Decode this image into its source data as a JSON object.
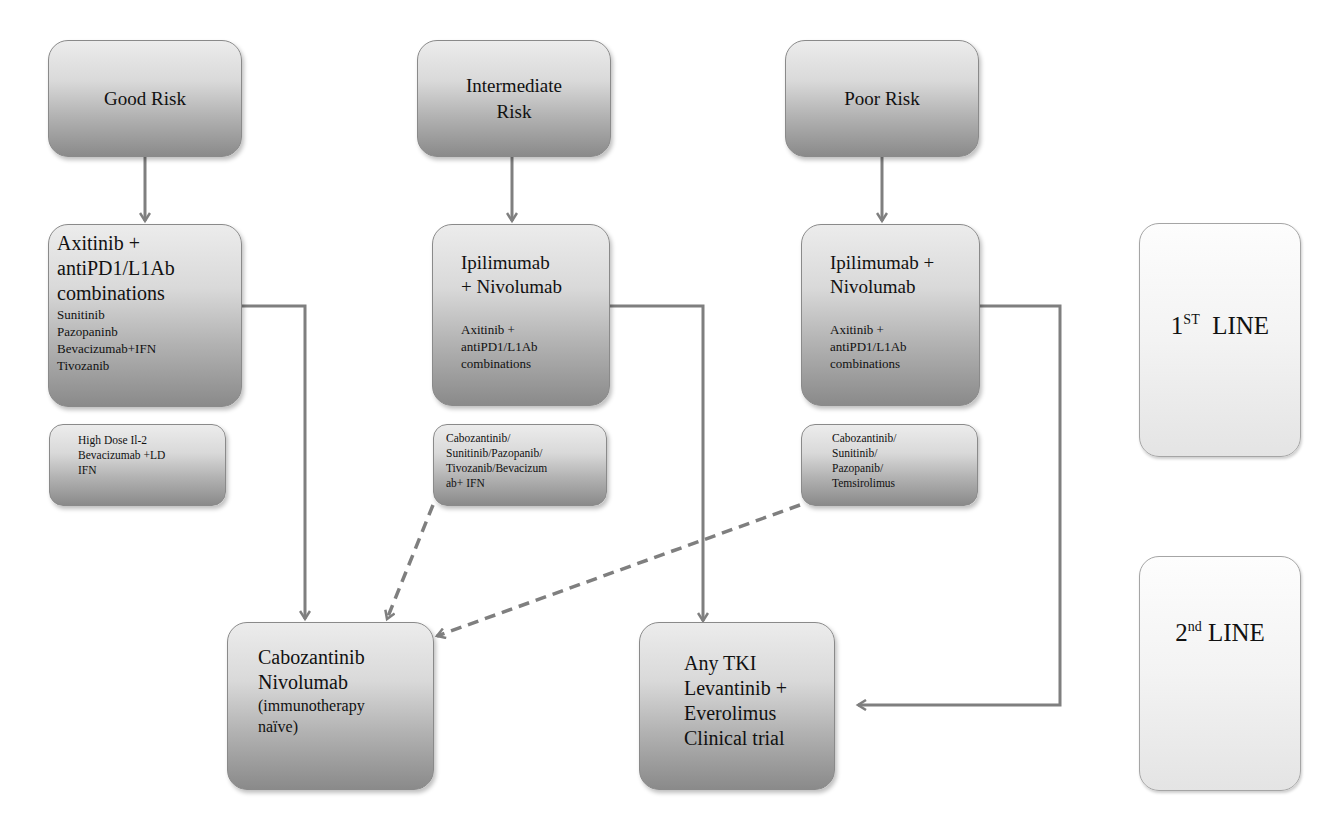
{
  "diagram": {
    "columns": {
      "good": {
        "risk_label": "Good Risk",
        "first_line": {
          "primary": "Axitinib +\nantiPD1/L1Ab\ncombinations",
          "secondary": "Sunitinib\nPazopaninb\nBevacizumab+IFN\nTivozanib"
        },
        "alternatives": "High Dose Il-2\nBevacizumab +LD\nIFN"
      },
      "intermediate": {
        "risk_label": "Intermediate\nRisk",
        "first_line": {
          "primary": "Ipilimumab\n+ Nivolumab",
          "secondary": "Axitinib +\nantiPD1/L1Ab\ncombinations"
        },
        "alternatives": "Cabozantinib/\nSunitinib/Pazopanib/\nTivozanib/Bevacizum\nab+ IFN"
      },
      "poor": {
        "risk_label": "Poor Risk",
        "first_line": {
          "primary": "Ipilimumab +\nNivolumab",
          "secondary": "Axitinib +\nantiPD1/L1Ab\ncombinations"
        },
        "alternatives": "Cabozantinib/\nSunitinib/\nPazopanib/\nTemsirolimus"
      }
    },
    "second_line": {
      "after_tki": {
        "main": "Cabozantinib\nNivolumab",
        "note": "(immunotherapy\nnaïve)"
      },
      "after_io": "Any TKI\nLevantinib +\nEverolimus\nClinical trial"
    },
    "line_labels": {
      "first": {
        "number": "1",
        "suffix": "ST",
        "word": "LINE"
      },
      "second": {
        "number": "2",
        "suffix": "nd",
        "word": "LINE"
      }
    },
    "colors": {
      "arrow": "#7f7f7f",
      "box_top": "#ececec",
      "box_bottom": "#8a8a8a",
      "label_box": "#f3f3f3"
    },
    "edges": [
      {
        "from": "Good Risk",
        "to": "Axitinib + antiPD1/L1Ab combinations (good)",
        "style": "solid"
      },
      {
        "from": "Intermediate Risk",
        "to": "Ipilimumab + Nivolumab (intermediate)",
        "style": "solid"
      },
      {
        "from": "Poor Risk",
        "to": "Ipilimumab + Nivolumab (poor)",
        "style": "solid"
      },
      {
        "from": "Axitinib + antiPD1/L1Ab combinations (good)",
        "to": "Cabozantinib Nivolumab",
        "style": "solid"
      },
      {
        "from": "Ipilimumab + Nivolumab (intermediate)",
        "to": "Any TKI Levantinib + Everolimus Clinical trial",
        "style": "solid"
      },
      {
        "from": "Ipilimumab + Nivolumab (poor)",
        "to": "Any TKI Levantinib + Everolimus Clinical trial",
        "style": "solid"
      },
      {
        "from": "Cabozantinib/Sunitinib/Pazopanib/Tivozanib/Bevacizumab+ IFN",
        "to": "Cabozantinib Nivolumab",
        "style": "dashed"
      },
      {
        "from": "Cabozantinib/Sunitinib/Pazopanib/Temsirolimus",
        "to": "Cabozantinib Nivolumab",
        "style": "dashed"
      }
    ]
  }
}
